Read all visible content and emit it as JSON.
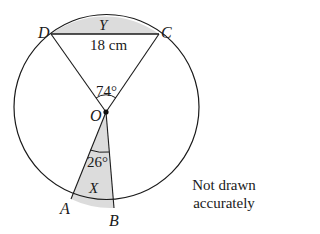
{
  "diagram": {
    "type": "circle-geometry",
    "points": {
      "D": "D",
      "C": "C",
      "O": "O",
      "A": "A",
      "B": "B"
    },
    "regions": {
      "segment_label": "Y",
      "sector_label": "X"
    },
    "measurements": {
      "chord_DC": "18 cm",
      "angle_DOC": "74°",
      "angle_AOB": "26°"
    },
    "note": {
      "line1": "Not drawn",
      "line2": "accurately"
    },
    "colors": {
      "stroke": "#1a1a1a",
      "shade": "#dcdcdc",
      "background": "#ffffff"
    }
  }
}
